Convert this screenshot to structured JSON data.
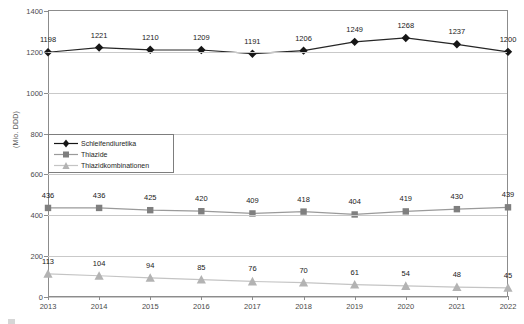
{
  "chart_data": {
    "type": "line",
    "title": "",
    "xlabel": "",
    "ylabel": "(Mio. DDD)",
    "categories": [
      "2013",
      "2014",
      "2015",
      "2016",
      "2017",
      "2018",
      "2019",
      "2020",
      "2021",
      "2022"
    ],
    "ylim": [
      0,
      1400
    ],
    "yticks": [
      0,
      200,
      400,
      600,
      800,
      1000,
      1200,
      1400
    ],
    "ytick_labels": [
      "0",
      "200",
      "400",
      "600",
      "800",
      "1000",
      "1200",
      "1400"
    ],
    "grid": true,
    "legend_position": "upper-left-inside",
    "series": [
      {
        "name": "Schleifendiuretika",
        "marker": "diamond",
        "color": "#161616",
        "values": [
          1198,
          1221,
          1210,
          1209,
          1191,
          1206,
          1249,
          1268,
          1237,
          1200
        ],
        "labels": [
          "1198",
          "1221",
          "1210",
          "1209",
          "1191",
          "1206",
          "1249",
          "1268",
          "1237",
          "1200"
        ]
      },
      {
        "name": "Thiazide",
        "marker": "square",
        "color": "#7f7f7f",
        "values": [
          436,
          436,
          425,
          420,
          409,
          418,
          404,
          419,
          430,
          439
        ],
        "labels": [
          "436",
          "436",
          "425",
          "420",
          "409",
          "418",
          "404",
          "419",
          "430",
          "439"
        ]
      },
      {
        "name": "Thiazidkombinationen",
        "marker": "triangle",
        "color": "#b3b3b3",
        "values": [
          113,
          104,
          94,
          85,
          76,
          70,
          61,
          54,
          48,
          45
        ],
        "labels": [
          "113",
          "104",
          "94",
          "85",
          "76",
          "70",
          "61",
          "54",
          "48",
          "45"
        ]
      }
    ]
  },
  "axes": {
    "y_title": "(Mio. DDD)"
  },
  "legend": {
    "items": [
      {
        "label": "Schleifendiuretika"
      },
      {
        "label": "Thiazide"
      },
      {
        "label": "Thiazidkombinationen"
      }
    ]
  },
  "caption": {
    "text": ""
  }
}
